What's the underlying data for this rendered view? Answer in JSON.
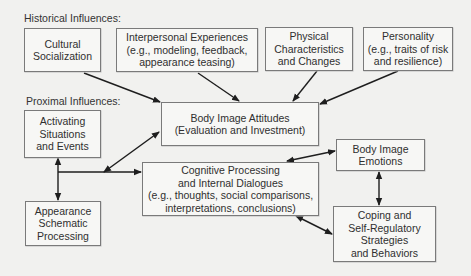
{
  "diagram": {
    "groups": {
      "historical": "Historical Influences:",
      "proximal": "Proximal Influences:"
    },
    "nodes": {
      "cultural": {
        "lines": [
          "Cultural",
          "Socialization"
        ]
      },
      "interpersonal": {
        "lines": [
          "Interpersonal Experiences",
          "(e.g., modeling, feedback,",
          "appearance teasing)"
        ]
      },
      "physical": {
        "lines": [
          "Physical",
          "Characteristics",
          "and Changes"
        ]
      },
      "personality": {
        "lines": [
          "Personality",
          "(e.g., traits of risk",
          "and resilience)"
        ]
      },
      "activating": {
        "lines": [
          "Activating",
          "Situations",
          "and Events"
        ]
      },
      "attitudes": {
        "lines": [
          "Body Image Attitudes",
          "(Evaluation and Investment)"
        ]
      },
      "appearance": {
        "lines": [
          "Appearance",
          "Schematic",
          "Processing"
        ]
      },
      "cognitive": {
        "lines": [
          "Cognitive Processing",
          "and Internal Dialogues",
          "(e.g., thoughts, social comparisons,",
          "interpretations, conclusions)"
        ]
      },
      "emotions": {
        "lines": [
          "Body Image",
          "Emotions"
        ]
      },
      "coping": {
        "lines": [
          "Coping and",
          "Self-Regulatory",
          "Strategies",
          "and Behaviors"
        ]
      }
    },
    "edges": [
      {
        "from": "cultural",
        "to": "attitudes",
        "type": "directed"
      },
      {
        "from": "interpersonal",
        "to": "attitudes",
        "type": "directed"
      },
      {
        "from": "physical",
        "to": "attitudes",
        "type": "directed"
      },
      {
        "from": "personality",
        "to": "attitudes",
        "type": "directed"
      },
      {
        "from": "activating",
        "to": "appearance",
        "type": "bidirectional"
      },
      {
        "from": "activating-appearance-line",
        "to": "cognitive",
        "type": "directed"
      },
      {
        "from": "activating-appearance-line",
        "to": "attitudes",
        "type": "bidirectional"
      },
      {
        "from": "cognitive",
        "to": "emotions",
        "type": "bidirectional"
      },
      {
        "from": "emotions",
        "to": "coping",
        "type": "bidirectional"
      },
      {
        "from": "cognitive",
        "to": "coping",
        "type": "bidirectional"
      }
    ]
  }
}
